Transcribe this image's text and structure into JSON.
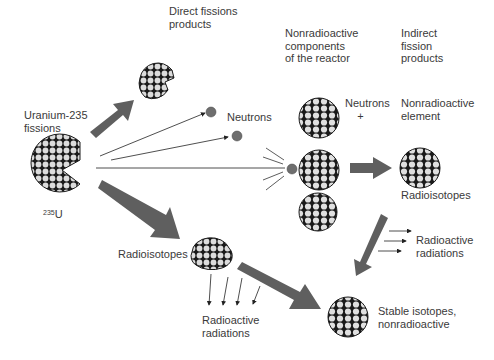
{
  "labels": {
    "direct_fission_products": "Direct fissions\nproducts",
    "nonradioactive_components": "Nonradioactive\ncomponents\nof the reactor",
    "indirect_fission_products": "Indirect\nfission\nproducts",
    "uranium_fissions": "Uranium-235\nfissions",
    "isotope_mass": "235",
    "isotope_symbol": "U",
    "neutrons": "Neutrons",
    "neutrons_plus": "Neutrons\n    +",
    "nonradioactive_element": "Nonradioactive\nelement",
    "radioisotopes_right": "Radioisotopes",
    "radioactive_radiations_right": "Radioactive\nradiations",
    "radioisotopes_left": "Radioisotopes",
    "radioactive_radiations_left": "Radioactive\nradiations",
    "stable_isotopes": "Stable isotopes,\nnonradioactive"
  },
  "colors": {
    "arrow": "#5f5f5f",
    "neutron": "#6e6e6e",
    "nucleus_fill": "#d9d9d9",
    "nucleus_stroke": "#1a1a1a",
    "text": "#3a3a3a"
  }
}
